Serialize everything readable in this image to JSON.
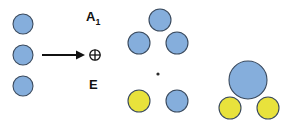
{
  "figure": {
    "canvas": {
      "width": 292,
      "height": 123,
      "background": "#ffffff"
    },
    "palette": {
      "blue_fill": "#85aedc",
      "yellow_fill": "#e8e23c",
      "outline": "#3a4a5e",
      "ink": "#111111"
    },
    "labels": {
      "a1": "A",
      "a1_subscript": "1",
      "e": "E",
      "plus_circle_symbol": "circled-plus"
    },
    "groups": [
      {
        "name": "reactant-stack",
        "circles": [
          {
            "id": "reactant-circle-1",
            "cx": 23,
            "cy": 24,
            "r": 10,
            "color": "#85aedc"
          },
          {
            "id": "reactant-circle-2",
            "cx": 23,
            "cy": 55,
            "r": 10,
            "color": "#85aedc"
          },
          {
            "id": "reactant-circle-3",
            "cx": 23,
            "cy": 86,
            "r": 10,
            "color": "#85aedc"
          }
        ]
      },
      {
        "name": "orbital-cluster",
        "circles": [
          {
            "id": "cluster-circle-top",
            "cx": 160,
            "cy": 20,
            "r": 11,
            "color": "#85aedc"
          },
          {
            "id": "cluster-circle-left",
            "cx": 139,
            "cy": 43,
            "r": 11,
            "color": "#85aedc"
          },
          {
            "id": "cluster-circle-right",
            "cx": 177,
            "cy": 43,
            "r": 11,
            "color": "#85aedc"
          },
          {
            "id": "cluster-circle-yellow-left",
            "cx": 139,
            "cy": 101,
            "r": 11,
            "color": "#e8e23c"
          },
          {
            "id": "cluster-circle-blue-right",
            "cx": 177,
            "cy": 101,
            "r": 11,
            "color": "#85aedc"
          }
        ],
        "dot": {
          "id": "cluster-center-dot",
          "cx": 158,
          "cy": 74,
          "r": 1.6
        }
      },
      {
        "name": "product-cluster",
        "circles": [
          {
            "id": "product-circle-large",
            "cx": 248,
            "cy": 80,
            "r": 19,
            "color": "#85aedc"
          },
          {
            "id": "product-circle-yellow-left",
            "cx": 230,
            "cy": 108,
            "r": 11,
            "color": "#e8e23c"
          },
          {
            "id": "product-circle-yellow-right",
            "cx": 268,
            "cy": 108,
            "r": 11,
            "color": "#e8e23c"
          }
        ]
      }
    ],
    "arrow": {
      "x1": 42,
      "y1": 55,
      "x2": 84,
      "y2": 55
    }
  }
}
